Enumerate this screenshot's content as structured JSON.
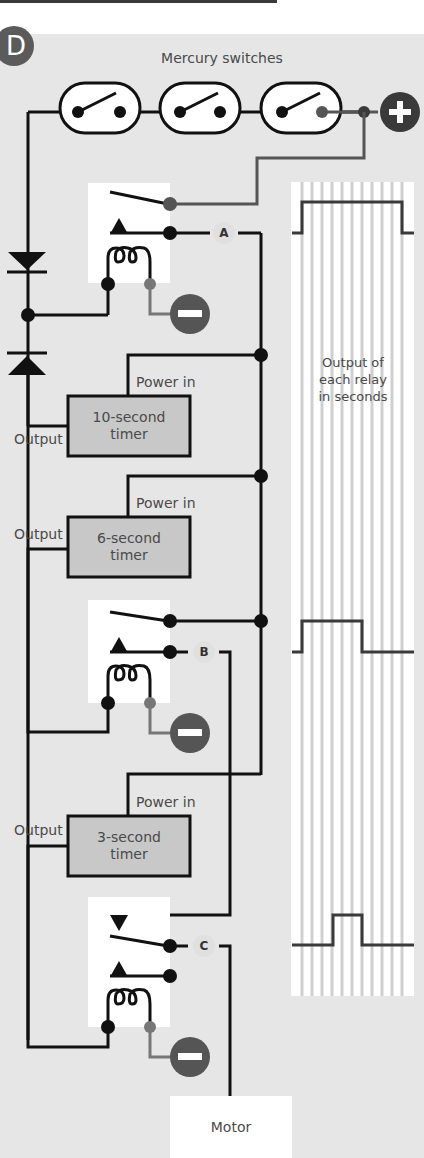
{
  "panel": {
    "badge": "D",
    "title": "Mercury switches"
  },
  "terminals": {
    "positive": "plus-terminal",
    "negative": "minus-terminal"
  },
  "relays": [
    {
      "id": "A",
      "label": "A"
    },
    {
      "id": "B",
      "label": "B"
    },
    {
      "id": "C",
      "label": "C"
    }
  ],
  "timers": [
    {
      "line1": "10-second",
      "line2": "timer",
      "power_label": "Power in",
      "output_label": "Output",
      "duration_s": 10
    },
    {
      "line1": "6-second",
      "line2": "timer",
      "power_label": "Power in",
      "output_label": "Output",
      "duration_s": 6
    },
    {
      "line1": "3-second",
      "line2": "timer",
      "power_label": "Power in",
      "output_label": "Output",
      "duration_s": 3
    }
  ],
  "legend": {
    "line1": "Output of",
    "line2": "each relay",
    "line3": "in seconds"
  },
  "motor": {
    "label": "Motor"
  },
  "waveforms": [
    {
      "relay": "A",
      "on_start_s": 0,
      "on_end_s": 10
    },
    {
      "relay": "B",
      "on_start_s": 0,
      "on_end_s": 6
    },
    {
      "relay": "C",
      "on_start_s": 3,
      "on_end_s": 6
    }
  ],
  "colors": {
    "wire": "#111111",
    "wire_gray": "#555555",
    "panel_bg": "#e6e6e6",
    "timer_fill": "#c8c8c8",
    "terminal_fill": "#555555"
  }
}
